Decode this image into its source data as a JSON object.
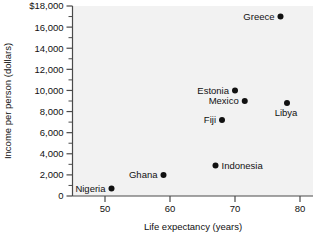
{
  "chart_data": {
    "type": "scatter",
    "title": "",
    "xlabel": "Life expectancy (years)",
    "ylabel": "Income per person (dollars)",
    "xlim": [
      45,
      82
    ],
    "ylim": [
      0,
      18000
    ],
    "xticks": [
      50,
      60,
      70,
      80
    ],
    "xtick_labels": [
      "50",
      "60",
      "70",
      "80"
    ],
    "yticks": [
      0,
      2000,
      4000,
      6000,
      8000,
      10000,
      12000,
      14000,
      16000,
      18000
    ],
    "ytick_labels": [
      "0",
      "2,000",
      "4,000",
      "6,000",
      "8,000",
      "10,000",
      "12,000",
      "14,000",
      "16,000",
      "$18,000"
    ],
    "y_minor_ticks": [
      1000,
      3000,
      5000,
      7000,
      9000,
      11000,
      13000,
      15000,
      17000
    ],
    "grid": false,
    "legend": false,
    "points": [
      {
        "label": "Greece",
        "x": 77.0,
        "y": 17000,
        "label_pos": "left"
      },
      {
        "label": "Libya",
        "x": 78.0,
        "y": 8800,
        "label_pos": "below"
      },
      {
        "label": "Estonia",
        "x": 70.0,
        "y": 10000,
        "label_pos": "left"
      },
      {
        "label": "Mexico",
        "x": 71.5,
        "y": 9000,
        "label_pos": "left"
      },
      {
        "label": "Fiji",
        "x": 68.0,
        "y": 7200,
        "label_pos": "left"
      },
      {
        "label": "Indonesia",
        "x": 67.0,
        "y": 2900,
        "label_pos": "right"
      },
      {
        "label": "Ghana",
        "x": 59.0,
        "y": 2000,
        "label_pos": "left"
      },
      {
        "label": "Nigeria",
        "x": 51.0,
        "y": 700,
        "label_pos": "left"
      }
    ]
  },
  "colors": {
    "marker": "#111111",
    "axis": "#4a4a4a",
    "plot_background": "#f2f2f2",
    "page_background": "#ffffff",
    "text": "#111111"
  }
}
